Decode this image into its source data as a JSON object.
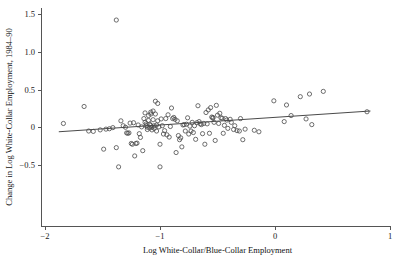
{
  "chart_data": {
    "type": "scatter",
    "title": "",
    "xlabel": "Log White-Collar/Blue-Collar Employment",
    "ylabel": "Change in Log White-Collar Employment, 1984–90",
    "xlim": [
      -2.0,
      1.0
    ],
    "ylim": [
      -0.62,
      1.55
    ],
    "grid": false,
    "legend": null,
    "xticks": [
      -2,
      -1,
      0,
      1
    ],
    "xticklabels": [
      "−2",
      "−1",
      "0",
      "1"
    ],
    "yticks": [
      -0.5,
      0,
      0.5,
      1.0,
      1.5
    ],
    "yticklabels": [
      "−0.5",
      "0",
      "0.5",
      "1.0",
      "1.5"
    ],
    "marker": "open-circle",
    "marker_size": 2.1,
    "fit_line": {
      "x": [
        -1.88,
        0.83
      ],
      "y": [
        -0.06,
        0.215
      ],
      "slope": 0.101,
      "intercept": 0.131
    },
    "points": [
      [
        -1.84,
        0.05
      ],
      [
        -1.66,
        0.275
      ],
      [
        -1.62,
        -0.05
      ],
      [
        -1.58,
        -0.055
      ],
      [
        -1.52,
        -0.035
      ],
      [
        -1.49,
        -0.29
      ],
      [
        -1.47,
        -0.025
      ],
      [
        -1.44,
        -0.02
      ],
      [
        -1.41,
        -0.005
      ],
      [
        -1.38,
        1.42
      ],
      [
        -1.38,
        -0.27
      ],
      [
        -1.36,
        -0.525
      ],
      [
        -1.34,
        0.085
      ],
      [
        -1.32,
        0.02
      ],
      [
        -1.3,
        0.0
      ],
      [
        -1.29,
        -0.075
      ],
      [
        -1.28,
        -0.08
      ],
      [
        -1.27,
        -0.075
      ],
      [
        -1.26,
        0.055
      ],
      [
        -1.25,
        -0.215
      ],
      [
        -1.24,
        -0.225
      ],
      [
        -1.23,
        0.06
      ],
      [
        -1.22,
        -0.38
      ],
      [
        -1.21,
        -0.215
      ],
      [
        -1.2,
        -0.21
      ],
      [
        -1.19,
        0.03
      ],
      [
        -1.18,
        -0.085
      ],
      [
        -1.17,
        -0.135
      ],
      [
        -1.16,
        0.005
      ],
      [
        -1.15,
        -0.31
      ],
      [
        -1.14,
        0.115
      ],
      [
        -1.13,
        0.19
      ],
      [
        -1.13,
        0.065
      ],
      [
        -1.12,
        0.045
      ],
      [
        -1.12,
        0.02
      ],
      [
        -1.11,
        0.0
      ],
      [
        -1.11,
        -0.03
      ],
      [
        -1.1,
        0.155
      ],
      [
        -1.1,
        0.09
      ],
      [
        -1.09,
        0.04
      ],
      [
        -1.09,
        -0.01
      ],
      [
        -1.08,
        0.2
      ],
      [
        -1.08,
        0.175
      ],
      [
        -1.08,
        0.025
      ],
      [
        -1.07,
        0.0
      ],
      [
        -1.07,
        -0.035
      ],
      [
        -1.06,
        0.215
      ],
      [
        -1.06,
        0.1
      ],
      [
        -1.05,
        0.02
      ],
      [
        -1.05,
        -0.015
      ],
      [
        -1.04,
        0.345
      ],
      [
        -1.04,
        0.175
      ],
      [
        -1.03,
        0.03
      ],
      [
        -1.03,
        -0.05
      ],
      [
        -1.02,
        0.315
      ],
      [
        -1.02,
        0.085
      ],
      [
        -1.01,
        0.005
      ],
      [
        -1.0,
        -0.225
      ],
      [
        -1.0,
        -0.525
      ],
      [
        -0.99,
        0.11
      ],
      [
        -0.98,
        0.02
      ],
      [
        -0.97,
        -0.09
      ],
      [
        -0.96,
        -0.045
      ],
      [
        -0.95,
        0.115
      ],
      [
        -0.94,
        -0.1
      ],
      [
        -0.93,
        0.165
      ],
      [
        -0.92,
        -0.13
      ],
      [
        -0.91,
        0.01
      ],
      [
        -0.9,
        0.255
      ],
      [
        -0.89,
        0.115
      ],
      [
        -0.88,
        0.13
      ],
      [
        -0.87,
        0.105
      ],
      [
        -0.86,
        -0.335
      ],
      [
        -0.85,
        0.085
      ],
      [
        -0.84,
        -0.11
      ],
      [
        -0.83,
        -0.165
      ],
      [
        -0.82,
        -0.14
      ],
      [
        -0.81,
        -0.26
      ],
      [
        -0.8,
        0.03
      ],
      [
        -0.79,
        0.035
      ],
      [
        -0.78,
        -0.05
      ],
      [
        -0.77,
        0.04
      ],
      [
        -0.76,
        0.125
      ],
      [
        -0.75,
        -0.09
      ],
      [
        -0.74,
        0.015
      ],
      [
        -0.73,
        -0.05
      ],
      [
        -0.72,
        0.065
      ],
      [
        -0.71,
        -0.07
      ],
      [
        -0.7,
        0.02
      ],
      [
        -0.69,
        -0.16
      ],
      [
        -0.68,
        0.06
      ],
      [
        -0.67,
        0.285
      ],
      [
        -0.66,
        0.075
      ],
      [
        -0.65,
        0.045
      ],
      [
        -0.64,
        0.035
      ],
      [
        -0.63,
        -0.085
      ],
      [
        -0.62,
        0.05
      ],
      [
        -0.61,
        -0.225
      ],
      [
        -0.6,
        0.195
      ],
      [
        -0.59,
        0.045
      ],
      [
        -0.58,
        0.23
      ],
      [
        -0.57,
        -0.08
      ],
      [
        -0.56,
        0.26
      ],
      [
        -0.55,
        0.135
      ],
      [
        -0.54,
        0.13
      ],
      [
        -0.54,
        0.12
      ],
      [
        -0.53,
        0.065
      ],
      [
        -0.52,
        -0.175
      ],
      [
        -0.51,
        0.29
      ],
      [
        -0.5,
        0.16
      ],
      [
        -0.49,
        0.05
      ],
      [
        -0.48,
        0.185
      ],
      [
        -0.47,
        0.125
      ],
      [
        -0.46,
        0.12
      ],
      [
        -0.45,
        -0.08
      ],
      [
        -0.44,
        0.025
      ],
      [
        -0.43,
        0.115
      ],
      [
        -0.42,
        0.095
      ],
      [
        -0.41,
        -0.015
      ],
      [
        -0.39,
        0.105
      ],
      [
        -0.38,
        0.065
      ],
      [
        -0.36,
        -0.03
      ],
      [
        -0.35,
        0.02
      ],
      [
        -0.33,
        -0.045
      ],
      [
        -0.31,
        -0.05
      ],
      [
        -0.3,
        0.115
      ],
      [
        -0.28,
        -0.165
      ],
      [
        -0.26,
        -0.025
      ],
      [
        -0.18,
        -0.04
      ],
      [
        -0.14,
        -0.06
      ],
      [
        -0.01,
        0.35
      ],
      [
        0.08,
        0.075
      ],
      [
        0.1,
        0.295
      ],
      [
        0.14,
        0.155
      ],
      [
        0.22,
        0.405
      ],
      [
        0.27,
        0.11
      ],
      [
        0.3,
        0.44
      ],
      [
        0.32,
        0.035
      ],
      [
        0.42,
        0.475
      ],
      [
        0.8,
        0.205
      ]
    ]
  }
}
